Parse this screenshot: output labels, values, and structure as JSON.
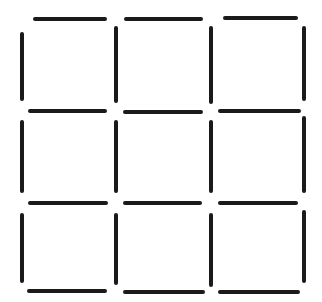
{
  "figure": {
    "grid_rows": 3,
    "grid_cols": 3,
    "square_count": 9,
    "segment_count": 24,
    "background_color": "#ffffff",
    "stroke_color": "#1a1a1a",
    "stroke_thickness": 4,
    "canvas_width": 322,
    "canvas_height": 302,
    "segments": {
      "horizontal": [
        {
          "x": 33,
          "y": 17,
          "length": 74
        },
        {
          "x": 124,
          "y": 17,
          "length": 79
        },
        {
          "x": 223,
          "y": 16,
          "length": 75
        },
        {
          "x": 28,
          "y": 109,
          "length": 79
        },
        {
          "x": 123,
          "y": 110,
          "length": 80
        },
        {
          "x": 218,
          "y": 109,
          "length": 83
        },
        {
          "x": 28,
          "y": 201,
          "length": 80
        },
        {
          "x": 123,
          "y": 201,
          "length": 79
        },
        {
          "x": 218,
          "y": 201,
          "length": 80
        },
        {
          "x": 27,
          "y": 289,
          "length": 80
        },
        {
          "x": 123,
          "y": 290,
          "length": 82
        },
        {
          "x": 218,
          "y": 290,
          "length": 82
        }
      ],
      "vertical": [
        {
          "x": 20,
          "y": 32,
          "length": 69
        },
        {
          "x": 20,
          "y": 120,
          "length": 73
        },
        {
          "x": 20,
          "y": 213,
          "length": 70
        },
        {
          "x": 114,
          "y": 26,
          "length": 77
        },
        {
          "x": 114,
          "y": 120,
          "length": 73
        },
        {
          "x": 114,
          "y": 213,
          "length": 72
        },
        {
          "x": 209,
          "y": 26,
          "length": 78
        },
        {
          "x": 209,
          "y": 120,
          "length": 73
        },
        {
          "x": 209,
          "y": 213,
          "length": 74
        },
        {
          "x": 302,
          "y": 26,
          "length": 75
        },
        {
          "x": 302,
          "y": 116,
          "length": 77
        },
        {
          "x": 302,
          "y": 210,
          "length": 73
        }
      ]
    }
  }
}
